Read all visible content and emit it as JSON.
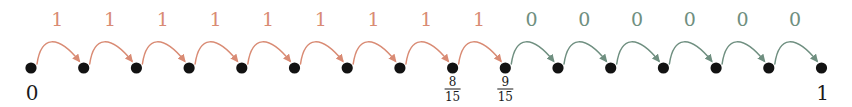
{
  "figure": {
    "kind": "number-line-binary-expansion",
    "width": 852,
    "height": 107,
    "background": "#ffffff"
  },
  "colors": {
    "one_arc": "#d98b74",
    "one_label": "#d98b74",
    "zero_arc": "#6f8f80",
    "zero_label": "#6f8f80",
    "dot": "#121212",
    "text": "#1a1a1a"
  },
  "geometry": {
    "dot_start_x": 31,
    "dot_spacing": 52.7,
    "dot_count": 16,
    "dot_cy": 68,
    "dot_r": 5.6,
    "arc_peak_y": 34,
    "label_y": 26
  },
  "nodes": [
    {
      "index": 0,
      "label": "0",
      "label_type": "integer"
    },
    {
      "index": 1,
      "label": "",
      "label_type": "none"
    },
    {
      "index": 2,
      "label": "",
      "label_type": "none"
    },
    {
      "index": 3,
      "label": "",
      "label_type": "none"
    },
    {
      "index": 4,
      "label": "",
      "label_type": "none"
    },
    {
      "index": 5,
      "label": "",
      "label_type": "none"
    },
    {
      "index": 6,
      "label": "",
      "label_type": "none"
    },
    {
      "index": 7,
      "label": "",
      "label_type": "none"
    },
    {
      "index": 8,
      "label": "8/15",
      "label_type": "fraction",
      "numerator": "8",
      "denominator": "15"
    },
    {
      "index": 9,
      "label": "9/15",
      "label_type": "fraction",
      "numerator": "9",
      "denominator": "15"
    },
    {
      "index": 10,
      "label": "",
      "label_type": "none"
    },
    {
      "index": 11,
      "label": "",
      "label_type": "none"
    },
    {
      "index": 12,
      "label": "",
      "label_type": "none"
    },
    {
      "index": 13,
      "label": "",
      "label_type": "none"
    },
    {
      "index": 14,
      "label": "",
      "label_type": "none"
    },
    {
      "index": 15,
      "label": "1",
      "label_type": "integer"
    }
  ],
  "arcs": [
    {
      "index": 0,
      "from": 0,
      "to": 1,
      "label": "1",
      "color_key": "one"
    },
    {
      "index": 1,
      "from": 1,
      "to": 2,
      "label": "1",
      "color_key": "one"
    },
    {
      "index": 2,
      "from": 2,
      "to": 3,
      "label": "1",
      "color_key": "one"
    },
    {
      "index": 3,
      "from": 3,
      "to": 4,
      "label": "1",
      "color_key": "one"
    },
    {
      "index": 4,
      "from": 4,
      "to": 5,
      "label": "1",
      "color_key": "one"
    },
    {
      "index": 5,
      "from": 5,
      "to": 6,
      "label": "1",
      "color_key": "one"
    },
    {
      "index": 6,
      "from": 6,
      "to": 7,
      "label": "1",
      "color_key": "one"
    },
    {
      "index": 7,
      "from": 7,
      "to": 8,
      "label": "1",
      "color_key": "one"
    },
    {
      "index": 8,
      "from": 8,
      "to": 9,
      "label": "1",
      "color_key": "one"
    },
    {
      "index": 9,
      "from": 9,
      "to": 10,
      "label": "0",
      "color_key": "zero"
    },
    {
      "index": 10,
      "from": 10,
      "to": 11,
      "label": "0",
      "color_key": "zero"
    },
    {
      "index": 11,
      "from": 11,
      "to": 12,
      "label": "0",
      "color_key": "zero"
    },
    {
      "index": 12,
      "from": 12,
      "to": 13,
      "label": "0",
      "color_key": "zero"
    },
    {
      "index": 13,
      "from": 13,
      "to": 14,
      "label": "0",
      "color_key": "zero"
    },
    {
      "index": 14,
      "from": 14,
      "to": 15,
      "label": "0",
      "color_key": "zero"
    }
  ],
  "sequence": {
    "one_count": 9,
    "zero_count": 6,
    "total_arcs": 15,
    "string": "111111111000000"
  }
}
